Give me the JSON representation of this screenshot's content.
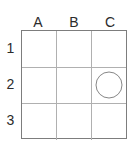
{
  "figure": {
    "name": "grid-with-marker",
    "background_color": "#ffffff",
    "border_color": "#7d7d7d",
    "gridline_color": "#b0b0b0",
    "label_color": "#2b2b2b",
    "marker_color": "#878787"
  },
  "grid": {
    "columns": 3,
    "rows": 3,
    "column_labels": [
      "A",
      "B",
      "C"
    ],
    "row_labels": [
      "1",
      "2",
      "3"
    ],
    "cells": [
      [
        {
          "id": "A1",
          "marker": "none"
        },
        {
          "id": "B1",
          "marker": "none"
        },
        {
          "id": "C1",
          "marker": "none"
        }
      ],
      [
        {
          "id": "A2",
          "marker": "none"
        },
        {
          "id": "B2",
          "marker": "none"
        },
        {
          "id": "C2",
          "marker": "circle"
        }
      ],
      [
        {
          "id": "A3",
          "marker": "none"
        },
        {
          "id": "B3",
          "marker": "none"
        },
        {
          "id": "C3",
          "marker": "none"
        }
      ]
    ]
  }
}
